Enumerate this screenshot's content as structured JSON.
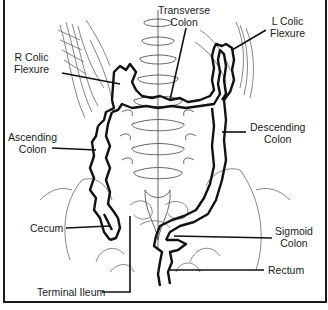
{
  "figure": {
    "stroke_color": "#111111",
    "bone_color": "#555555",
    "labels": [
      {
        "id": "transverse-colon",
        "lines": [
          "Transverse",
          "Colon"
        ]
      },
      {
        "id": "l-colic-flexure",
        "lines": [
          "L Colic",
          "Flexure"
        ]
      },
      {
        "id": "r-colic-flexure",
        "lines": [
          "R Colic",
          "Flexure"
        ]
      },
      {
        "id": "ascending-colon",
        "lines": [
          "Ascending",
          "Colon"
        ]
      },
      {
        "id": "descending-colon",
        "lines": [
          "Descending",
          "Colon"
        ]
      },
      {
        "id": "cecum",
        "lines": [
          "Cecum"
        ]
      },
      {
        "id": "sigmoid-colon",
        "lines": [
          "Sigmoid",
          "Colon"
        ]
      },
      {
        "id": "rectum",
        "lines": [
          "Rectum"
        ]
      },
      {
        "id": "terminal-ileum",
        "lines": [
          "Terminal Ileum"
        ]
      }
    ]
  }
}
